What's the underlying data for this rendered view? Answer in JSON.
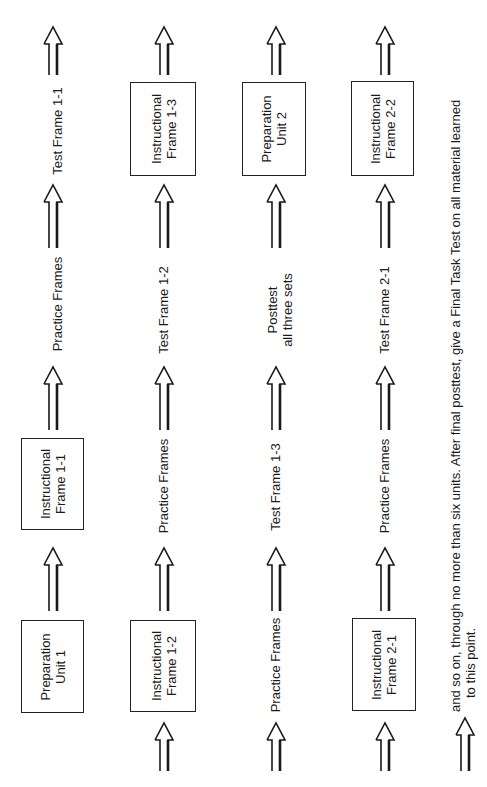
{
  "diagram": {
    "orientation": "rotated-90-ccw",
    "flow_direction": "bottom-to-top within each column, columns read left to right",
    "columns": [
      {
        "id": "col1",
        "steps": [
          {
            "type": "box",
            "lines": [
              "Preparation",
              "Unit 1"
            ]
          },
          {
            "type": "arrow"
          },
          {
            "type": "box",
            "lines": [
              "Instructional",
              "Frame 1-1"
            ]
          },
          {
            "type": "arrow"
          },
          {
            "type": "text",
            "lines": [
              "Practice Frames"
            ]
          },
          {
            "type": "arrow"
          },
          {
            "type": "text",
            "lines": [
              "Test Frame 1-1"
            ]
          },
          {
            "type": "arrow"
          }
        ]
      },
      {
        "id": "col2",
        "steps": [
          {
            "type": "arrow"
          },
          {
            "type": "box",
            "lines": [
              "Instructional",
              "Frame 1-2"
            ]
          },
          {
            "type": "arrow"
          },
          {
            "type": "text",
            "lines": [
              "Practice Frames"
            ]
          },
          {
            "type": "arrow"
          },
          {
            "type": "text",
            "lines": [
              "Test Frame 1-2"
            ]
          },
          {
            "type": "arrow"
          },
          {
            "type": "box",
            "lines": [
              "Instructional",
              "Frame 1-3"
            ]
          },
          {
            "type": "arrow"
          }
        ]
      },
      {
        "id": "col3",
        "steps": [
          {
            "type": "arrow"
          },
          {
            "type": "text",
            "lines": [
              "Practice Frames"
            ]
          },
          {
            "type": "arrow"
          },
          {
            "type": "text",
            "lines": [
              "Test Frame 1-3"
            ]
          },
          {
            "type": "arrow"
          },
          {
            "type": "text",
            "lines": [
              "Posttest",
              "all three sets"
            ]
          },
          {
            "type": "arrow"
          },
          {
            "type": "box",
            "lines": [
              "Preparation",
              "Unit 2"
            ]
          },
          {
            "type": "arrow"
          }
        ]
      },
      {
        "id": "col4",
        "steps": [
          {
            "type": "arrow"
          },
          {
            "type": "box",
            "lines": [
              "Instructional",
              "Frame 2-1"
            ]
          },
          {
            "type": "arrow"
          },
          {
            "type": "text",
            "lines": [
              "Practice Frames"
            ]
          },
          {
            "type": "arrow"
          },
          {
            "type": "text",
            "lines": [
              "Test Frame 2-1"
            ]
          },
          {
            "type": "arrow"
          },
          {
            "type": "box",
            "lines": [
              "Instructional",
              "Frame 2-2"
            ]
          },
          {
            "type": "arrow"
          }
        ]
      }
    ],
    "footnote": {
      "line1": "and so on, through no more than six units. After final posttest, give a Final Task Test on all material learned",
      "line2": "to this point."
    }
  },
  "labels": {
    "prep1_l1": "Preparation",
    "prep1_l2": "Unit 1",
    "inst11_l1": "Instructional",
    "inst11_l2": "Frame 1-1",
    "practice": "Practice Frames",
    "test11": "Test Frame 1-1",
    "inst12_l1": "Instructional",
    "inst12_l2": "Frame 1-2",
    "test12": "Test Frame 1-2",
    "inst13_l1": "Instructional",
    "inst13_l2": "Frame 1-3",
    "test13": "Test Frame 1-3",
    "post_l1": "Posttest",
    "post_l2": "all three sets",
    "prep2_l1": "Preparation",
    "prep2_l2": "Unit 2",
    "inst21_l1": "Instructional",
    "inst21_l2": "Frame 2-1",
    "test21": "Test Frame 2-1",
    "inst22_l1": "Instructional",
    "inst22_l2": "Frame 2-2",
    "note_l1": "and so on, through no more than six units. After final posttest, give a Final Task Test on all material learned",
    "note_l2": "to this point."
  },
  "colors": {
    "ink": "#1a1a1a",
    "background": "#ffffff"
  }
}
